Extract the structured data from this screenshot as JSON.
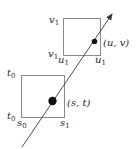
{
  "diagram": {
    "upper_square": {
      "top_left_label": {
        "base": "v",
        "sub": "1"
      },
      "bottom_left_v_label": {
        "base": "v",
        "sub": "1"
      },
      "bottom_left_u_label": {
        "base": "u",
        "sub": "1"
      },
      "bottom_right_label": {
        "base": "u",
        "sub": "1"
      },
      "point_label": "(u, v)"
    },
    "lower_square": {
      "top_left_label": {
        "base": "t",
        "sub": "0"
      },
      "bottom_left_t_label": {
        "base": "t",
        "sub": "0"
      },
      "bottom_left_s_label": {
        "base": "s",
        "sub": "0"
      },
      "bottom_right_label": {
        "base": "s",
        "sub": "1"
      },
      "point_label": "(s, t)"
    },
    "colors": {
      "square_stroke": "#8a8a8a",
      "line": "#3a3a3a",
      "dot": "#111111"
    }
  }
}
